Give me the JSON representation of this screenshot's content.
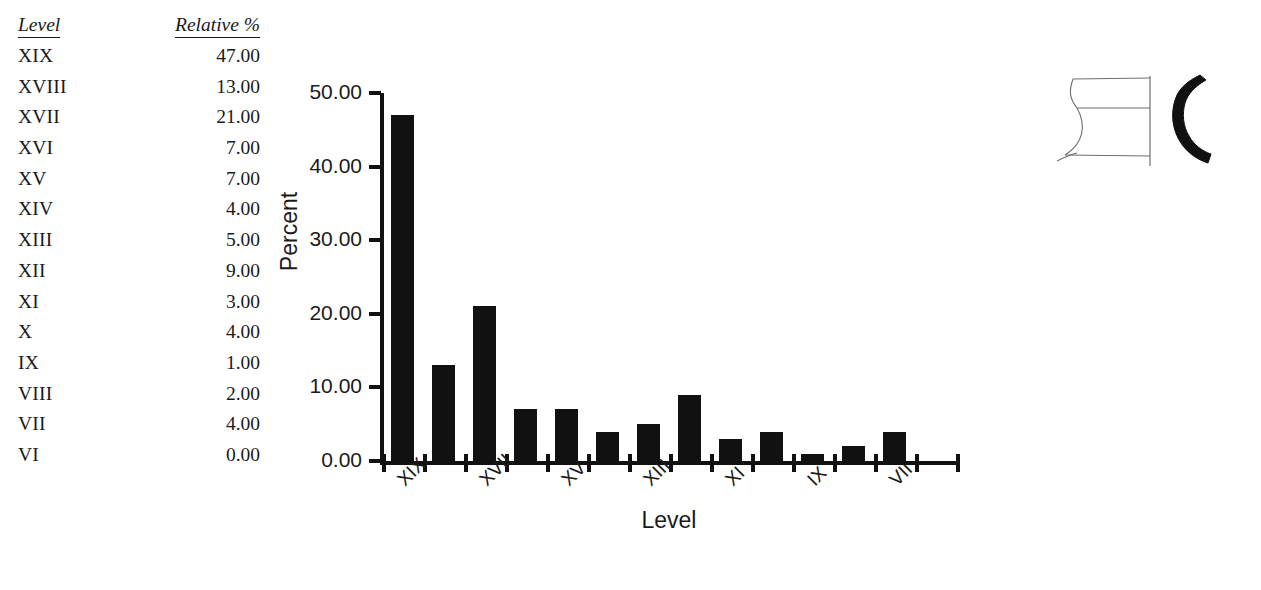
{
  "table": {
    "headers": [
      "Level",
      "Relative %"
    ],
    "rows": [
      {
        "level": "XIX",
        "pct": "47.00"
      },
      {
        "level": "XVIII",
        "pct": "13.00"
      },
      {
        "level": "XVII",
        "pct": "21.00"
      },
      {
        "level": "XVI",
        "pct": "7.00"
      },
      {
        "level": "XV",
        "pct": "7.00"
      },
      {
        "level": "XIV",
        "pct": "4.00"
      },
      {
        "level": "XIII",
        "pct": "5.00"
      },
      {
        "level": "XII",
        "pct": "9.00"
      },
      {
        "level": "XI",
        "pct": "3.00"
      },
      {
        "level": "X",
        "pct": "4.00"
      },
      {
        "level": "IX",
        "pct": "1.00"
      },
      {
        "level": "VIII",
        "pct": "2.00"
      },
      {
        "level": "VII",
        "pct": "4.00"
      },
      {
        "level": "VI",
        "pct": "0.00"
      }
    ]
  },
  "chart_data": {
    "type": "bar",
    "title": "",
    "xlabel": "Level",
    "ylabel": "Percent",
    "categories": [
      "XIX",
      "XVIII",
      "XVII",
      "XVI",
      "XV",
      "XIV",
      "XIII",
      "XII",
      "XI",
      "X",
      "IX",
      "VIII",
      "VII",
      "VI"
    ],
    "values": [
      47.0,
      13.0,
      21.0,
      7.0,
      7.0,
      4.0,
      5.0,
      9.0,
      3.0,
      4.0,
      1.0,
      2.0,
      4.0,
      0.0
    ],
    "ylim": [
      0,
      50
    ],
    "ytick_labels": [
      "0.00",
      "10.00",
      "20.00",
      "30.00",
      "40.00",
      "50.00"
    ],
    "ytick_values": [
      0,
      10,
      20,
      30,
      40,
      50
    ],
    "xtick_labels_shown": [
      "XIX",
      "XVII",
      "XV",
      "XIII",
      "XI",
      "IX",
      "VII"
    ],
    "xtick_label_indices": [
      0,
      2,
      4,
      6,
      8,
      10,
      12
    ],
    "grid": false,
    "legend": false,
    "bar_color": "#111111"
  },
  "illustration": {
    "name": "ceramic-vessel-profile-drawing",
    "outline_color": "#6e6e6e",
    "section_color": "#111111"
  }
}
